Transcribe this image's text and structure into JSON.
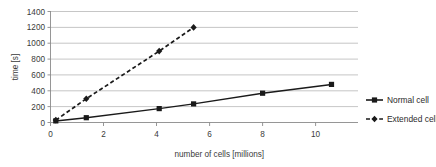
{
  "chart_data": {
    "type": "line",
    "title": "",
    "xlabel": "number of cells [millions]",
    "ylabel": "time [s]",
    "xlim": [
      0,
      11.6
    ],
    "ylim": [
      0,
      1400
    ],
    "xticks": [
      "0",
      "2",
      "4",
      "6",
      "8",
      "10"
    ],
    "xtick_values": [
      0,
      2,
      4,
      6,
      8,
      10
    ],
    "yticks": [
      "0",
      "200",
      "400",
      "600",
      "800",
      "1000",
      "1200",
      "1400"
    ],
    "ytick_values": [
      0,
      200,
      400,
      600,
      800,
      1000,
      1200,
      1400
    ],
    "grid": "horizontal",
    "legend_position": "right",
    "series": [
      {
        "name": "Normal cell",
        "marker": "square",
        "linestyle": "solid",
        "color": "#1a1a1a",
        "x": [
          0.2,
          1.35,
          4.1,
          5.4,
          8.0,
          10.6
        ],
        "values": [
          20,
          60,
          175,
          235,
          370,
          480
        ]
      },
      {
        "name": "Extended cell",
        "marker": "diamond",
        "linestyle": "dashed",
        "color": "#1a1a1a",
        "x": [
          0.2,
          1.35,
          4.1,
          5.4
        ],
        "values": [
          30,
          300,
          900,
          1200
        ]
      }
    ]
  },
  "legend": {
    "items": [
      {
        "label": "Normal cell"
      },
      {
        "label": "Extended cell"
      }
    ]
  },
  "colors": {
    "gridline": "#b7b7b7",
    "axis": "#8a8a8a",
    "series": "#1a1a1a",
    "background": "#ffffff"
  }
}
